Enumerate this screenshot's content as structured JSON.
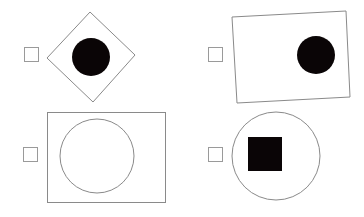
{
  "puzzle": {
    "options": [
      {
        "id": "top-left",
        "outer_shape": "diamond",
        "inner_shape": "filled-circle",
        "checked": false
      },
      {
        "id": "top-right",
        "outer_shape": "tilted-rectangle",
        "inner_shape": "filled-circle",
        "checked": false
      },
      {
        "id": "bottom-left",
        "outer_shape": "rectangle",
        "inner_shape": "outline-circle",
        "checked": false
      },
      {
        "id": "bottom-right",
        "outer_shape": "outline-circle",
        "inner_shape": "filled-square",
        "checked": false
      }
    ],
    "colors": {
      "stroke": "#8a8a8a",
      "fill": "#0a0506",
      "background": "#ffffff",
      "checkbox_border": "#9a9a9a"
    }
  }
}
